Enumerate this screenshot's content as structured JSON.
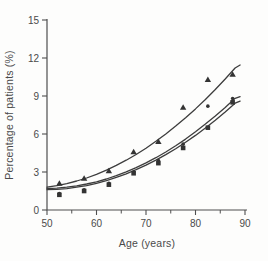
{
  "chart_data": {
    "type": "scatter",
    "title": "",
    "xlabel": "Age (years)",
    "ylabel": "Percentage of patients (%)",
    "xlim": [
      50,
      90
    ],
    "ylim": [
      0,
      15
    ],
    "xticks": [
      50,
      60,
      70,
      80,
      90
    ],
    "xticks_minor": [
      55,
      65,
      75,
      85
    ],
    "yticks": [
      0,
      3,
      6,
      9,
      12,
      15
    ],
    "grid": false,
    "legend": "none",
    "axis_color": "#4f4f4f",
    "line_color": "#3d3d3d",
    "marker_color": "#333333",
    "series": [
      {
        "name": "upper-series-triangles",
        "marker": "triangle",
        "x": [
          52.5,
          57.5,
          62.5,
          67.5,
          72.5,
          77.5,
          82.5,
          87.5
        ],
        "y": [
          2.1,
          2.5,
          3.1,
          4.6,
          5.4,
          8.1,
          10.3,
          10.7
        ],
        "trend": {
          "x": [
            50,
            52,
            54,
            56,
            58,
            60,
            62,
            64,
            66,
            68,
            70,
            72,
            74,
            76,
            78,
            80,
            82,
            84,
            86,
            88,
            89
          ],
          "y": [
            1.8,
            1.92,
            2.08,
            2.29,
            2.53,
            2.82,
            3.15,
            3.52,
            3.93,
            4.38,
            4.88,
            5.42,
            6.0,
            6.62,
            7.28,
            7.98,
            8.72,
            9.51,
            10.34,
            11.21,
            11.45
          ]
        }
      },
      {
        "name": "middle-series-circles",
        "marker": "circle",
        "x": [
          52.5,
          57.5,
          62.5,
          67.5,
          72.5,
          77.5,
          82.5,
          87.5
        ],
        "y": [
          1.3,
          1.6,
          2.1,
          3.0,
          3.9,
          5.2,
          8.2,
          8.8
        ],
        "trend": {
          "x": [
            50,
            52,
            54,
            56,
            58,
            60,
            62,
            64,
            66,
            68,
            70,
            72,
            74,
            76,
            78,
            80,
            82,
            84,
            86,
            88,
            89
          ],
          "y": [
            1.7,
            1.73,
            1.8,
            1.9,
            2.05,
            2.23,
            2.45,
            2.71,
            3.01,
            3.35,
            3.72,
            4.13,
            4.58,
            5.07,
            5.6,
            6.17,
            6.78,
            7.42,
            8.1,
            8.82,
            8.95
          ]
        }
      },
      {
        "name": "lower-series-squares",
        "marker": "square",
        "x": [
          52.5,
          57.5,
          62.5,
          67.5,
          72.5,
          77.5,
          82.5,
          87.5
        ],
        "y": [
          1.2,
          1.5,
          2.0,
          2.9,
          3.7,
          4.9,
          6.5,
          8.5
        ],
        "trend": {
          "x": [
            50,
            52,
            54,
            56,
            58,
            60,
            62,
            64,
            66,
            68,
            70,
            72,
            74,
            76,
            78,
            80,
            82,
            84,
            86,
            88,
            89
          ],
          "y": [
            1.6,
            1.63,
            1.69,
            1.8,
            1.93,
            2.11,
            2.32,
            2.57,
            2.86,
            3.18,
            3.54,
            3.94,
            4.37,
            4.84,
            5.35,
            5.89,
            6.47,
            7.09,
            7.74,
            8.43,
            8.6
          ]
        }
      }
    ]
  }
}
